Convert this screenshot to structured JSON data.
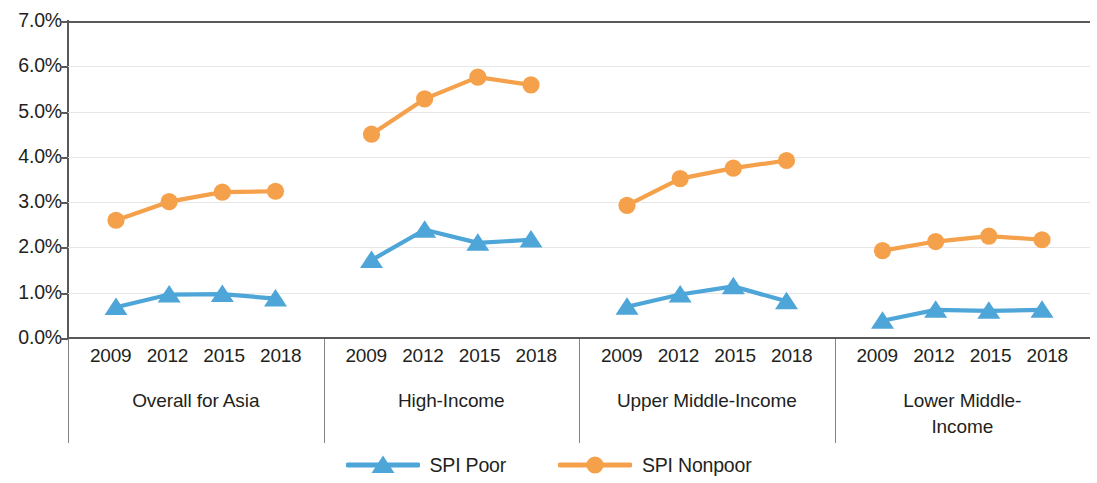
{
  "chart_data": {
    "type": "line",
    "title": "",
    "xlabel": "",
    "ylabel": "",
    "ylim": [
      0,
      7
    ],
    "y_tick_labels": [
      "7.0%",
      "6.0%",
      "5.0%",
      "4.0%",
      "3.0%",
      "2.0%",
      "1.0%",
      "0.0%"
    ],
    "y_tick_values": [
      7,
      6,
      5,
      4,
      3,
      2,
      1,
      0
    ],
    "grid": true,
    "legend_position": "bottom",
    "categories": [
      "2009",
      "2012",
      "2015",
      "2018"
    ],
    "panels": [
      {
        "label": "Overall for Asia",
        "label_lines": [
          "Overall for Asia"
        ],
        "years": [
          "2009",
          "2012",
          "2015",
          "2018"
        ],
        "series": [
          {
            "name": "SPI Poor",
            "values": [
              0.68,
              0.96,
              0.97,
              0.87
            ]
          },
          {
            "name": "SPI Nonpoor",
            "values": [
              2.6,
              3.01,
              3.22,
              3.24
            ]
          }
        ]
      },
      {
        "label": "High-Income",
        "label_lines": [
          "High-Income"
        ],
        "years": [
          "2009",
          "2012",
          "2015",
          "2018"
        ],
        "series": [
          {
            "name": "SPI Poor",
            "values": [
              1.72,
              2.39,
              2.1,
              2.17
            ]
          },
          {
            "name": "SPI Nonpoor",
            "values": [
              4.5,
              5.28,
              5.76,
              5.59
            ]
          }
        ]
      },
      {
        "label": "Upper Middle-Income",
        "label_lines": [
          "Upper Middle-Income"
        ],
        "years": [
          "2009",
          "2012",
          "2015",
          "2018"
        ],
        "series": [
          {
            "name": "SPI Poor",
            "values": [
              0.69,
              0.96,
              1.14,
              0.81
            ]
          },
          {
            "name": "SPI Nonpoor",
            "values": [
              2.93,
              3.52,
              3.75,
              3.92
            ]
          }
        ]
      },
      {
        "label": "Lower Middle-Income",
        "label_lines": [
          "Lower Middle-",
          "Income"
        ],
        "years": [
          "2009",
          "2012",
          "2015",
          "2018"
        ],
        "series": [
          {
            "name": "SPI Poor",
            "values": [
              0.38,
              0.62,
              0.6,
              0.62
            ]
          },
          {
            "name": "SPI Nonpoor",
            "values": [
              1.93,
              2.13,
              2.25,
              2.17
            ]
          }
        ]
      }
    ],
    "legend": [
      {
        "name": "SPI Poor",
        "color": "#4da5d8",
        "marker": "triangle"
      },
      {
        "name": "SPI Nonpoor",
        "color": "#f5a14b",
        "marker": "circle"
      }
    ],
    "colors": {
      "poor": "#4da5d8",
      "nonpoor": "#f5a14b",
      "axis": "#58595b",
      "grid": "#e9e6e8",
      "text": "#231f20"
    }
  }
}
